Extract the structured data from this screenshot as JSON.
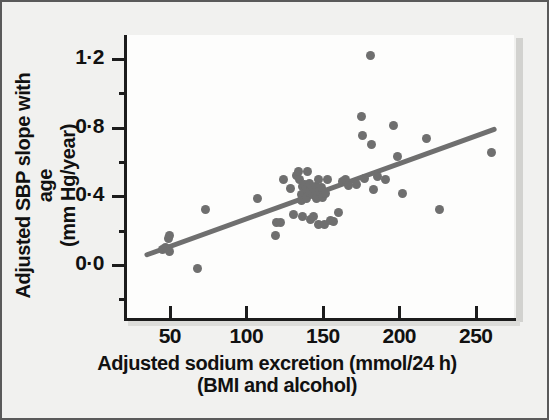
{
  "chart_data": {
    "type": "scatter",
    "title": "",
    "xlabel": "Adjusted sodium excretion (mmol/24 h)",
    "xlabel_line2": "(BMI and alcohol)",
    "ylabel": "Adjusted SBP slope with age",
    "ylabel_line2": "(mm Hg/year)",
    "xlim": [
      20,
      275
    ],
    "ylim": [
      -0.32,
      1.34
    ],
    "xticks": [
      50,
      100,
      150,
      200,
      250
    ],
    "xtick_labels": [
      "50",
      "100",
      "150",
      "200",
      "250"
    ],
    "yticks": [
      0.0,
      0.4,
      0.8,
      1.2
    ],
    "ytick_labels": [
      "0·0",
      "0·4",
      "0·8",
      "1·2"
    ],
    "yticks_minor": [
      0.2,
      0.6,
      1.0,
      -0.2
    ],
    "grid": false,
    "legend": null,
    "marker_color": "#6f6f6f",
    "line_color": "#6f6f6f",
    "axis_color": "#1c1c1c",
    "panel_color": "#fdfdfc",
    "background_color": "#f1f1ef",
    "trend_line": {
      "x": [
        35,
        262
      ],
      "y": [
        0.06,
        0.79
      ],
      "slope": 0.00322,
      "intercept": -0.0527
    },
    "points": [
      {
        "x": 45,
        "y": 0.09
      },
      {
        "x": 47,
        "y": 0.1
      },
      {
        "x": 49,
        "y": 0.155
      },
      {
        "x": 50,
        "y": 0.175
      },
      {
        "x": 50,
        "y": 0.08
      },
      {
        "x": 68,
        "y": -0.02
      },
      {
        "x": 73,
        "y": 0.325
      },
      {
        "x": 107,
        "y": 0.385
      },
      {
        "x": 119,
        "y": 0.175
      },
      {
        "x": 120,
        "y": 0.245
      },
      {
        "x": 122,
        "y": 0.25
      },
      {
        "x": 124,
        "y": 0.5
      },
      {
        "x": 129,
        "y": 0.445
      },
      {
        "x": 131,
        "y": 0.295
      },
      {
        "x": 133,
        "y": 0.52
      },
      {
        "x": 134,
        "y": 0.545
      },
      {
        "x": 135,
        "y": 0.5
      },
      {
        "x": 136,
        "y": 0.41
      },
      {
        "x": 136,
        "y": 0.375
      },
      {
        "x": 137,
        "y": 0.455
      },
      {
        "x": 137,
        "y": 0.285
      },
      {
        "x": 138,
        "y": 0.47
      },
      {
        "x": 139,
        "y": 0.44
      },
      {
        "x": 139,
        "y": 0.39
      },
      {
        "x": 140,
        "y": 0.545
      },
      {
        "x": 141,
        "y": 0.425
      },
      {
        "x": 141,
        "y": 0.475
      },
      {
        "x": 142,
        "y": 0.265
      },
      {
        "x": 143,
        "y": 0.445
      },
      {
        "x": 143,
        "y": 0.41
      },
      {
        "x": 144,
        "y": 0.28
      },
      {
        "x": 145,
        "y": 0.46
      },
      {
        "x": 145,
        "y": 0.425
      },
      {
        "x": 146,
        "y": 0.385
      },
      {
        "x": 147,
        "y": 0.5
      },
      {
        "x": 147,
        "y": 0.235
      },
      {
        "x": 148,
        "y": 0.43
      },
      {
        "x": 149,
        "y": 0.45
      },
      {
        "x": 150,
        "y": 0.395
      },
      {
        "x": 151,
        "y": 0.235
      },
      {
        "x": 152,
        "y": 0.415
      },
      {
        "x": 153,
        "y": 0.5
      },
      {
        "x": 155,
        "y": 0.26
      },
      {
        "x": 157,
        "y": 0.255
      },
      {
        "x": 160,
        "y": 0.305
      },
      {
        "x": 163,
        "y": 0.485
      },
      {
        "x": 165,
        "y": 0.5
      },
      {
        "x": 167,
        "y": 0.465
      },
      {
        "x": 172,
        "y": 0.47
      },
      {
        "x": 175,
        "y": 0.865
      },
      {
        "x": 176,
        "y": 0.755
      },
      {
        "x": 177,
        "y": 0.505
      },
      {
        "x": 181,
        "y": 1.22
      },
      {
        "x": 182,
        "y": 0.705
      },
      {
        "x": 183,
        "y": 0.44
      },
      {
        "x": 186,
        "y": 0.515
      },
      {
        "x": 191,
        "y": 0.5
      },
      {
        "x": 196,
        "y": 0.81
      },
      {
        "x": 199,
        "y": 0.635
      },
      {
        "x": 202,
        "y": 0.415
      },
      {
        "x": 218,
        "y": 0.735
      },
      {
        "x": 226,
        "y": 0.325
      },
      {
        "x": 260,
        "y": 0.655
      }
    ]
  }
}
